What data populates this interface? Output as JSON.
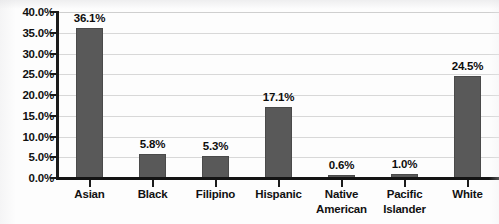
{
  "chart_data": {
    "type": "bar",
    "title": "",
    "subtitle": "",
    "xlabel": "",
    "ylabel": "",
    "categories": [
      "Asian",
      "Black",
      "Filipino",
      "Hispanic",
      "Native American",
      "Pacific Islander",
      "White"
    ],
    "values": [
      36.1,
      5.8,
      5.3,
      17.1,
      0.6,
      1.0,
      24.5
    ],
    "value_labels": [
      "36.1%",
      "5.8%",
      "5.3%",
      "17.1%",
      "0.6%",
      "1.0%",
      "24.5%"
    ],
    "ylim": [
      0,
      40
    ],
    "ytick_values": [
      0,
      5,
      10,
      15,
      20,
      25,
      30,
      35,
      40
    ],
    "ytick_labels": [
      "0.0%",
      "5.0%",
      "10.0%",
      "15.0%",
      "20.0%",
      "25.0%",
      "30.0%",
      "35.0%",
      "40.0%"
    ],
    "grid": true,
    "grid_axis": "y",
    "legend": false,
    "legend_position": "none",
    "series": [
      {
        "name": "Percent",
        "values": [
          36.1,
          5.8,
          5.3,
          17.1,
          0.6,
          1.0,
          24.5
        ]
      }
    ],
    "colors": {
      "bar_fill": "#595959",
      "bar_stroke": "#4a4a4a",
      "gridline": "#d8d8d8",
      "axis_line": "#141414",
      "text": "#111111",
      "background": "#fdfdfd"
    }
  },
  "category_label_lines": [
    [
      "Asian"
    ],
    [
      "Black"
    ],
    [
      "Filipino"
    ],
    [
      "Hispanic"
    ],
    [
      "Native",
      "American"
    ],
    [
      "Pacific",
      "Islander"
    ],
    [
      "White"
    ]
  ]
}
